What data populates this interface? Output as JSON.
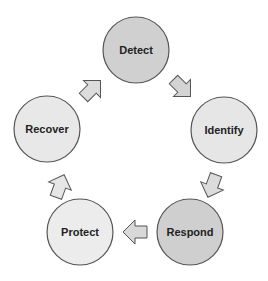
{
  "diagram": {
    "type": "cycle",
    "nodes": [
      {
        "id": "detect",
        "label": "Detect",
        "cx": 136,
        "cy": 50,
        "fill": "#d0d0d0"
      },
      {
        "id": "identify",
        "label": "Identify",
        "cx": 224,
        "cy": 130,
        "fill": "#e6e6e6"
      },
      {
        "id": "respond",
        "label": "Respond",
        "cx": 190,
        "cy": 232,
        "fill": "#cfcfcf"
      },
      {
        "id": "protect",
        "label": "Protect",
        "cx": 80,
        "cy": 232,
        "fill": "#ececec"
      },
      {
        "id": "recover",
        "label": "Recover",
        "cx": 47,
        "cy": 129,
        "fill": "#e8e8e8"
      }
    ],
    "edges": [
      {
        "from": "recover",
        "to": "detect"
      },
      {
        "from": "detect",
        "to": "identify"
      },
      {
        "from": "identify",
        "to": "respond"
      },
      {
        "from": "respond",
        "to": "protect"
      },
      {
        "from": "protect",
        "to": "recover"
      }
    ],
    "colors": {
      "stroke": "#555555",
      "arrow_fill": "#dcdcdc"
    }
  }
}
